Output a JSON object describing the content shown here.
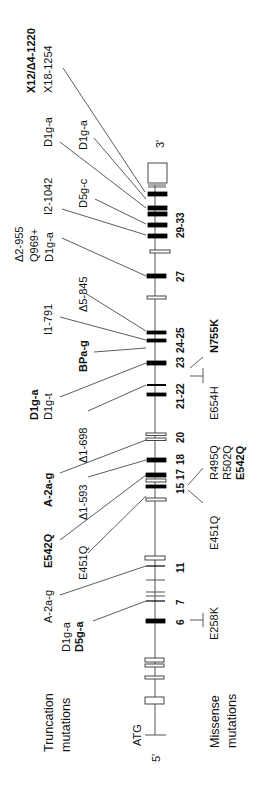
{
  "figure": {
    "orientation": "rotated-90-ccw",
    "gene_ends": {
      "five_prime": "5'",
      "three_prime": "3'",
      "start_codon": "ATG"
    },
    "row_labels": {
      "truncation": [
        "Truncation",
        "mutations"
      ],
      "missense": [
        "Missense",
        "mutations"
      ]
    },
    "exon_labels": [
      {
        "text": "6",
        "y": 645
      },
      {
        "text": "7",
        "y": 603
      },
      {
        "text": "11",
        "y": 567
      },
      {
        "text": "15",
        "y": 520
      },
      {
        "text": "17",
        "y": 504
      },
      {
        "text": "18",
        "y": 485
      },
      {
        "text": "20",
        "y": 436
      },
      {
        "text": "21-22",
        "y": 403
      },
      {
        "text": "23",
        "y": 362
      },
      {
        "text": "24-25",
        "y": 338
      },
      {
        "text": "27",
        "y": 275
      },
      {
        "text": "29-33",
        "y": 223
      }
    ],
    "truncation_mutations": [
      {
        "id": "t1",
        "lines": [
          "X12/Δ4-1220"
        ],
        "bold": [
          true
        ],
        "x": 30,
        "y": 90
      },
      {
        "id": "t2",
        "lines": [
          "X18-1254"
        ],
        "bold": [
          false
        ],
        "x": 50,
        "y": 92
      },
      {
        "id": "t3",
        "lines": [
          "D1g-a"
        ],
        "bold": [
          false
        ],
        "x": 52,
        "y": 146
      },
      {
        "id": "t4",
        "lines": [
          "D1g-a"
        ],
        "bold": [
          false
        ],
        "x": 86,
        "y": 150
      },
      {
        "id": "t5",
        "lines": [
          "I2-1042"
        ],
        "bold": [
          false
        ],
        "x": 52,
        "y": 212
      },
      {
        "id": "t6",
        "lines": [
          "D5g-c"
        ],
        "bold": [
          false
        ],
        "x": 86,
        "y": 206
      },
      {
        "id": "t7",
        "lines": [
          "Δ2-955",
          "Q969+",
          "D1g-a"
        ],
        "bold": [
          false,
          false,
          false
        ],
        "x": 22,
        "y": 262
      },
      {
        "id": "t8",
        "lines": [
          "Δ5-845"
        ],
        "bold": [
          false
        ],
        "x": 86,
        "y": 310
      },
      {
        "id": "t9",
        "lines": [
          "I1-791"
        ],
        "bold": [
          false
        ],
        "x": 52,
        "y": 333
      },
      {
        "id": "t10",
        "lines": [
          "BPa-g"
        ],
        "bold": [
          true
        ],
        "x": 86,
        "y": 371
      },
      {
        "id": "t11",
        "lines": [
          "D1g-a",
          "D1g-t"
        ],
        "bold": [
          true,
          false
        ],
        "x": 36,
        "y": 420
      },
      {
        "id": "t12",
        "lines": [
          "Δ1-698"
        ],
        "bold": [
          false
        ],
        "x": 86,
        "y": 462
      },
      {
        "id": "t13",
        "lines": [
          "A-2a-g"
        ],
        "bold": [
          true
        ],
        "x": 52,
        "y": 505
      },
      {
        "id": "t14",
        "lines": [
          "Δ1-593"
        ],
        "bold": [
          false
        ],
        "x": 86,
        "y": 520
      },
      {
        "id": "t15",
        "lines": [
          "E542Q"
        ],
        "bold": [
          true
        ],
        "x": 52,
        "y": 566
      },
      {
        "id": "t16",
        "lines": [
          "E451Q"
        ],
        "bold": [
          false
        ],
        "x": 86,
        "y": 578
      },
      {
        "id": "t17",
        "lines": [
          "A-2a-g"
        ],
        "bold": [
          false
        ],
        "x": 52,
        "y": 622
      },
      {
        "id": "t18",
        "lines": [
          "D1g-a",
          "D5g-a"
        ],
        "bold": [
          false,
          true
        ],
        "x": 70,
        "y": 650
      }
    ],
    "missense_mutations": [
      {
        "id": "m1",
        "lines": [
          "N755K"
        ],
        "bold": [
          true
        ],
        "x": 216,
        "y": 351
      },
      {
        "id": "m2",
        "lines": [
          "E654H"
        ],
        "bold": [
          false
        ],
        "x": 216,
        "y": 420
      },
      {
        "id": "m3",
        "lines": [
          "R495Q",
          "R502Q",
          "E542Q"
        ],
        "bold": [
          false,
          false,
          true
        ],
        "x": 216,
        "y": 480
      },
      {
        "id": "m4",
        "lines": [
          "E451Q"
        ],
        "bold": [
          false
        ],
        "x": 216,
        "y": 548
      },
      {
        "id": "m5",
        "lines": [
          "E258K"
        ],
        "bold": [
          false
        ],
        "x": 216,
        "y": 640
      }
    ]
  }
}
